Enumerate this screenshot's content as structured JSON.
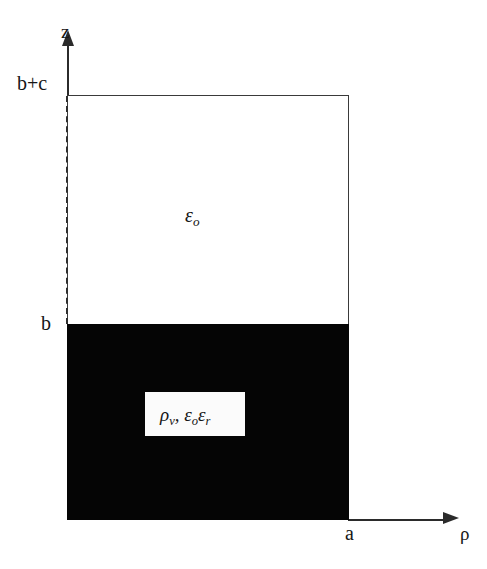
{
  "figure": {
    "type": "cross-section-diagram",
    "background_color": "#ffffff",
    "line_color": "#2b2b2b",
    "fill_color": "#050505",
    "axes": {
      "vertical": {
        "name": "z-axis",
        "label": "z"
      },
      "horizontal": {
        "name": "rho-axis",
        "label": "ρ"
      }
    },
    "tick_labels": {
      "z_top": "b+c",
      "z_mid": "b",
      "rho_right": "a"
    },
    "regions": [
      {
        "name": "free-space-region",
        "label": "ε",
        "subscript": "o",
        "fill": "white",
        "description": "upper rectangular region"
      },
      {
        "name": "dielectric-region",
        "label": "",
        "subscript": "",
        "fill": "black",
        "description": "lower filled rectangular region"
      }
    ],
    "material_label": {
      "charge_density": "ρ",
      "charge_density_sub": "v",
      "separator": ",",
      "permittivity_free": "ε",
      "permittivity_free_sub": "o",
      "permittivity_rel": "ε",
      "permittivity_rel_sub": "r"
    }
  }
}
